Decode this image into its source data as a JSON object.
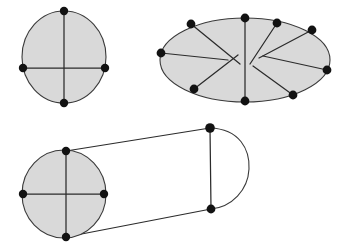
{
  "figure": {
    "background_color": "#ffffff",
    "fill_color": "#d9d9d9",
    "stroke_color": "#3a3a3a",
    "vertex_color": "#121212",
    "canvas": {
      "width": 348,
      "height": 251
    }
  },
  "panels": [
    {
      "id": "disk-with-cross",
      "name": "circle-with-two-diameters",
      "shape": "circle",
      "center": [
        64,
        57
      ],
      "radius_x": 42,
      "radius_y": 47,
      "vertices": [
        {
          "label": "top",
          "x": 64,
          "y": 11
        },
        {
          "label": "right",
          "x": 105,
          "y": 68
        },
        {
          "label": "bottom",
          "x": 64,
          "y": 103
        },
        {
          "label": "left",
          "x": 23,
          "y": 68
        }
      ],
      "cuts": [
        {
          "from": [
            64,
            11
          ],
          "to": [
            64,
            103
          ]
        },
        {
          "from": [
            23,
            68
          ],
          "to": [
            105,
            68
          ]
        }
      ]
    },
    {
      "id": "ellipse-with-spokes",
      "name": "ellipse-with-radial-cuts",
      "shape": "ellipse",
      "center": [
        245,
        60
      ],
      "radius_x": 85,
      "radius_y": 42,
      "vertices": [
        {
          "label": "top-center",
          "x": 245,
          "y": 18
        },
        {
          "label": "upper-left",
          "x": 191,
          "y": 24
        },
        {
          "label": "left",
          "x": 161,
          "y": 53
        },
        {
          "label": "lower-left",
          "x": 194,
          "y": 89
        },
        {
          "label": "bottom-center",
          "x": 245,
          "y": 101
        },
        {
          "label": "lower-right",
          "x": 293,
          "y": 95
        },
        {
          "label": "right",
          "x": 327,
          "y": 70
        },
        {
          "label": "upper-right",
          "x": 312,
          "y": 30
        },
        {
          "label": "upper-right-inner",
          "x": 277,
          "y": 23
        }
      ],
      "cuts": [
        {
          "from": [
            245,
            18
          ],
          "to": [
            245,
            101
          ]
        },
        {
          "from": [
            191,
            24
          ],
          "to": [
            240,
            64
          ]
        },
        {
          "from": [
            161,
            53
          ],
          "to": [
            228,
            60
          ]
        },
        {
          "from": [
            194,
            89
          ],
          "to": [
            238,
            56
          ]
        },
        {
          "from": [
            277,
            23
          ],
          "to": [
            250,
            64
          ]
        },
        {
          "from": [
            312,
            30
          ],
          "to": [
            259,
            58
          ]
        },
        {
          "from": [
            327,
            70
          ],
          "to": [
            263,
            56
          ]
        },
        {
          "from": [
            293,
            95
          ],
          "to": [
            253,
            66
          ]
        }
      ]
    },
    {
      "id": "cylinder-capsule",
      "name": "cylinder-with-round-cap",
      "shape": "cylinder",
      "face": {
        "center": [
          64,
          194
        ],
        "radius_x": 42,
        "radius_y": 45,
        "vertices": [
          {
            "label": "top",
            "x": 66,
            "y": 151
          },
          {
            "label": "right",
            "x": 104,
            "y": 194
          },
          {
            "label": "bottom",
            "x": 66,
            "y": 237
          },
          {
            "label": "left",
            "x": 23,
            "y": 194
          }
        ],
        "cuts": [
          {
            "from": [
              66,
              151
            ],
            "to": [
              66,
              237
            ]
          },
          {
            "from": [
              23,
              194
            ],
            "to": [
              104,
              194
            ]
          }
        ]
      },
      "cap": {
        "top_vertex": [
          210,
          128
        ],
        "bottom_vertex": [
          211,
          209
        ],
        "arc_extent_x": 247,
        "spine": {
          "from": [
            210,
            128
          ],
          "to": [
            211,
            209
          ]
        }
      },
      "rulings": [
        {
          "from": [
            66,
            151
          ],
          "to": [
            210,
            128
          ]
        },
        {
          "from": [
            66,
            237
          ],
          "to": [
            211,
            209
          ]
        }
      ]
    }
  ],
  "counts": {
    "circle_vertices": 4,
    "ellipse_vertices": 9,
    "cylinder_face_vertices": 4,
    "cap_vertices": 2
  }
}
